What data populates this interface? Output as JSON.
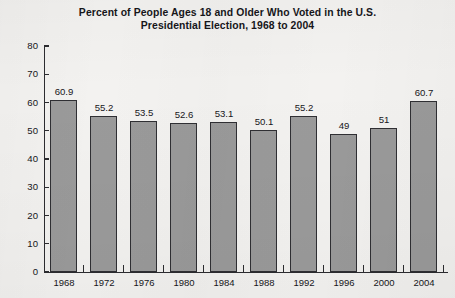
{
  "chart_data": {
    "type": "bar",
    "title": "Percent of People Ages 18 and Older Who Voted in the U.S. Presidential Election, 1968 to 2004",
    "title_lines": [
      "Percent of People Ages 18 and Older Who Voted in the U.S.",
      "Presidential Election, 1968 to 2004"
    ],
    "xlabel": "",
    "ylabel": "",
    "categories": [
      "1968",
      "1972",
      "1976",
      "1980",
      "1984",
      "1988",
      "1992",
      "1996",
      "2000",
      "2004"
    ],
    "values": [
      60.9,
      55.2,
      53.5,
      52.6,
      53.1,
      50.1,
      55.2,
      49,
      51,
      60.7
    ],
    "value_labels": [
      "60.9",
      "55.2",
      "53.5",
      "52.6",
      "53.1",
      "50.1",
      "55.2",
      "49",
      "51",
      "60.7"
    ],
    "ylim": [
      0,
      80
    ],
    "ytick_values": [
      0,
      10,
      20,
      30,
      40,
      50,
      60,
      70,
      80
    ],
    "ytick_labels": [
      "0",
      "10",
      "20",
      "30",
      "40",
      "50",
      "60",
      "70",
      "80"
    ],
    "grid": false,
    "legend": null,
    "bar_color": "#9a9a9a",
    "bar_border_color": "#2f2f33",
    "axis_color": "#2c2c30",
    "text_color": "#16161a",
    "background_color": "#f3f2f0"
  }
}
